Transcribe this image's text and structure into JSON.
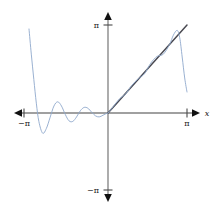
{
  "figure": {
    "background": "#ffffff",
    "width": 216,
    "height": 212
  },
  "labels": {
    "y_top": "π",
    "y_bottom": "−π",
    "x_left": "−π",
    "x_right": "π",
    "x_axis_name": "x"
  },
  "colors": {
    "axis": "#808080",
    "exact_curve": "#4a4a52",
    "fourier_curve": "#8fa8cc",
    "text": "#1a1a1a"
  },
  "chart_data": {
    "type": "line",
    "title": "",
    "xlabel": "x",
    "ylabel": "",
    "xlim": [
      -3.14159,
      3.14159
    ],
    "ylim": [
      -3.14159,
      3.14159
    ],
    "xticks": [
      -3.14159,
      3.14159
    ],
    "xticklabels": [
      "−π",
      "π"
    ],
    "yticks": [
      -3.14159,
      3.14159
    ],
    "yticklabels": [
      "−π",
      "π"
    ],
    "grid": false,
    "legend": "none",
    "axes_style": "arrows-both-ends",
    "series": [
      {
        "name": "f(x) = x",
        "color": "#4a4a52",
        "kind": "exact",
        "description": "Straight line y = x drawn from the origin up to x = π",
        "x": [
          0,
          0.3927,
          0.7854,
          1.1781,
          1.5708,
          1.9635,
          2.3562,
          2.7489,
          3.14159
        ],
        "y": [
          0,
          0.3927,
          0.7854,
          1.1781,
          1.5708,
          1.9635,
          2.3562,
          2.7489,
          3.14159
        ]
      },
      {
        "name": "Fourier partial sum of f(x) = x",
        "color": "#8fa8cc",
        "kind": "approximation",
        "description": "Partial sum of the Fourier sine series for the sawtooth extension of y = x; oscillates about zero on the left half, tracks y = x on the right half and overshoots (Gibbs phenomenon) near x = ±π",
        "x": [
          -3.14159,
          -3.05,
          -2.95,
          -2.85,
          -2.75,
          -2.6,
          -2.45,
          -2.3,
          -2.15,
          -2.0,
          -1.85,
          -1.7,
          -1.55,
          -1.4,
          -1.25,
          -1.1,
          -0.95,
          -0.8,
          -0.65,
          -0.5,
          -0.35,
          -0.2,
          -0.05,
          0,
          0.2,
          0.45,
          0.7,
          0.95,
          1.2,
          1.45,
          1.7,
          1.95,
          2.2,
          2.45,
          2.6,
          2.75,
          2.85,
          2.95,
          3.05,
          3.14159
        ],
        "y": [
          3.0,
          2.1,
          1.2,
          0.35,
          -0.3,
          -0.72,
          -0.55,
          -0.15,
          0.25,
          0.4,
          0.25,
          -0.05,
          -0.28,
          -0.3,
          -0.14,
          0.08,
          0.2,
          0.17,
          0.03,
          -0.1,
          -0.14,
          -0.08,
          -0.01,
          0,
          0.22,
          0.5,
          0.68,
          0.99,
          1.22,
          1.4,
          1.78,
          2.02,
          2.1,
          2.45,
          2.78,
          2.95,
          2.7,
          2.0,
          1.25,
          0.75
        ]
      }
    ]
  }
}
